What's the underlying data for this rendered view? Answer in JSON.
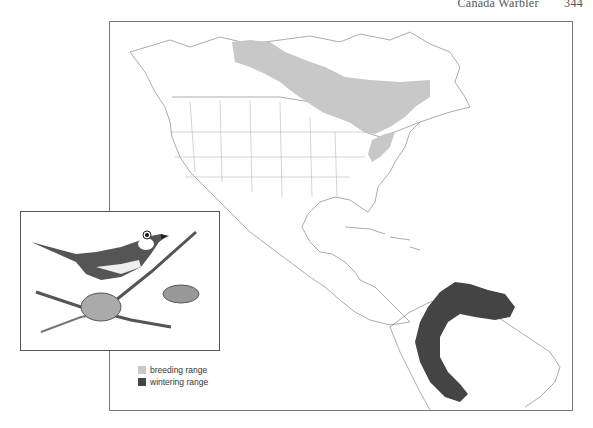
{
  "header": {
    "title": "Canada Warbler",
    "page_number": "344"
  },
  "map": {
    "subject": "Canada Warbler range map",
    "region": "North, Central and northern South America"
  },
  "illustration": {
    "subject": "Canada Warbler perched on branch"
  },
  "legend": {
    "items": [
      {
        "label": "breeding range",
        "color": "#c8c8c8"
      },
      {
        "label": "wintering range",
        "color": "#444444"
      }
    ]
  },
  "colors": {
    "breeding": "#c8c8c8",
    "wintering": "#444444",
    "outline": "#777777"
  }
}
